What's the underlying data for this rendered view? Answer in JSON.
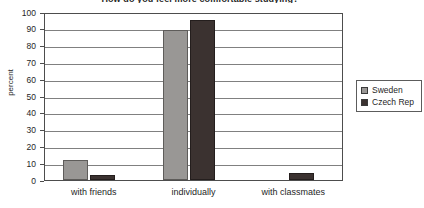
{
  "chart_data": {
    "type": "bar",
    "title": "How do you feel more comfortable studying?",
    "xlabel": "",
    "ylabel": "percent",
    "ylim": [
      0,
      100
    ],
    "ytick_step": 10,
    "yticks": [
      100,
      90,
      80,
      70,
      60,
      50,
      40,
      30,
      20,
      10,
      0
    ],
    "ytick_labels": [
      "100",
      "90",
      "80",
      "70",
      "60",
      "50",
      "40",
      "30",
      "20",
      "10",
      "0"
    ],
    "grid": true,
    "grid_axis": "y",
    "legend_position": "right",
    "categories": [
      "with friends",
      "individually",
      "with classmates"
    ],
    "series": [
      {
        "name": "Sweden",
        "color": "#999795",
        "values": [
          12,
          89,
          0
        ]
      },
      {
        "name": "Czech Rep",
        "color": "#3b3230",
        "values": [
          3,
          95,
          4
        ]
      }
    ]
  },
  "colors": {
    "series_sweden": "#999795",
    "series_czech": "#3b3230",
    "plot_border": "#4d4d4d",
    "gridline": "#808080",
    "text": "#262626",
    "background": "#ffffff"
  }
}
